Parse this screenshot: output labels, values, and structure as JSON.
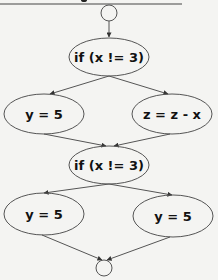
{
  "diagram": {
    "type": "control-flow-graph",
    "colors": {
      "background": "#f4f4f2",
      "stroke": "#555555",
      "text": "#111111"
    },
    "nodes": [
      {
        "id": "entry",
        "shape": "circle",
        "label": "",
        "cx": 109,
        "cy": 13,
        "r": 8
      },
      {
        "id": "cond1",
        "shape": "ellipse",
        "label": "if (x != 3)",
        "cx": 109,
        "cy": 57,
        "rx": 40,
        "ry": 19
      },
      {
        "id": "assign_y1",
        "shape": "ellipse",
        "label": "y = 5",
        "cx": 44,
        "cy": 114,
        "rx": 40,
        "ry": 20
      },
      {
        "id": "assign_z",
        "shape": "ellipse",
        "label": "z = z - x",
        "cx": 172,
        "cy": 114,
        "rx": 40,
        "ry": 20
      },
      {
        "id": "cond2",
        "shape": "ellipse",
        "label": "if (x != 3)",
        "cx": 109,
        "cy": 165,
        "rx": 40,
        "ry": 19
      },
      {
        "id": "assign_y2",
        "shape": "ellipse",
        "label": "y = 5",
        "cx": 44,
        "cy": 214,
        "rx": 40,
        "ry": 21
      },
      {
        "id": "assign_y3",
        "shape": "ellipse",
        "label": "y = 5",
        "cx": 173,
        "cy": 216,
        "rx": 40,
        "ry": 21
      },
      {
        "id": "exit",
        "shape": "circle",
        "label": "",
        "cx": 104,
        "cy": 268,
        "r": 8
      }
    ],
    "edges": [
      {
        "from": "entry",
        "to": "cond1",
        "x1": 109,
        "y1": 21,
        "x2": 109,
        "y2": 37
      },
      {
        "from": "cond1",
        "to": "assign_y1",
        "x1": 109,
        "y1": 76,
        "x2": 50,
        "y2": 94
      },
      {
        "from": "cond1",
        "to": "assign_z",
        "x1": 109,
        "y1": 76,
        "x2": 168,
        "y2": 94
      },
      {
        "from": "assign_y1",
        "to": "cond2",
        "x1": 44,
        "y1": 134,
        "x2": 106,
        "y2": 146
      },
      {
        "from": "assign_z",
        "to": "cond2",
        "x1": 170,
        "y1": 134,
        "x2": 114,
        "y2": 146
      },
      {
        "from": "cond2",
        "to": "assign_y2",
        "x1": 109,
        "y1": 184,
        "x2": 44,
        "y2": 193
      },
      {
        "from": "cond2",
        "to": "assign_y3",
        "x1": 109,
        "y1": 184,
        "x2": 172,
        "y2": 195
      },
      {
        "from": "assign_y2",
        "to": "exit",
        "x1": 42,
        "y1": 235,
        "x2": 102,
        "y2": 260
      },
      {
        "from": "assign_y3",
        "to": "exit",
        "x1": 170,
        "y1": 237,
        "x2": 107,
        "y2": 260
      }
    ]
  }
}
